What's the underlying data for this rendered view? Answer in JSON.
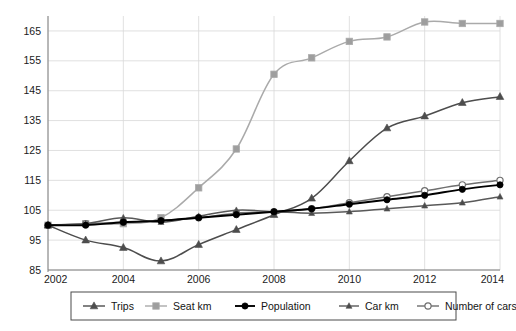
{
  "chart_data": {
    "type": "line",
    "title": "",
    "subtitle": "",
    "xlabel": "",
    "ylabel": "",
    "x": [
      2002,
      2003,
      2004,
      2005,
      2006,
      2007,
      2008,
      2009,
      2010,
      2011,
      2012,
      2013,
      2014
    ],
    "xlim": [
      2002,
      2014
    ],
    "ylim": [
      85,
      170
    ],
    "x_tick_labels": [
      "2002",
      "2004",
      "2006",
      "2008",
      "2010",
      "2012",
      "2014"
    ],
    "x_ticks": [
      2002,
      2004,
      2006,
      2008,
      2010,
      2012,
      2014
    ],
    "y_tick_labels": [
      "85",
      "95",
      "105",
      "115",
      "125",
      "135",
      "145",
      "155",
      "165"
    ],
    "y_ticks": [
      85,
      95,
      105,
      115,
      125,
      135,
      145,
      155,
      165
    ],
    "grid": true,
    "legend_position": "bottom",
    "series": [
      {
        "name": "Trips",
        "color": "#4d4d4d",
        "marker": "triangle",
        "marker_fill": "#4d4d4d",
        "values": [
          100,
          95,
          92.5,
          88,
          93.5,
          98.5,
          103.5,
          109,
          121.5,
          132.5,
          136.5,
          141,
          143
        ]
      },
      {
        "name": "Seat km",
        "color": "#aaaaaa",
        "marker": "square",
        "marker_fill": "#9e9e9e",
        "values": [
          100,
          100.5,
          100.5,
          102.5,
          112.5,
          125.5,
          150.5,
          156,
          161.5,
          163,
          168,
          167.5,
          167.5
        ]
      },
      {
        "name": "Population",
        "color": "#000000",
        "marker": "circle",
        "marker_fill": "#000000",
        "values": [
          100,
          100,
          101,
          101.5,
          102.5,
          103.5,
          104.5,
          105.5,
          107,
          108.5,
          110,
          112,
          113.5
        ]
      },
      {
        "name": "Car km",
        "color": "#595959",
        "marker": "triangle-small",
        "marker_fill": "#4a4a4a",
        "values": [
          100,
          100.5,
          102.5,
          101,
          103,
          105,
          104.5,
          104,
          104.5,
          105.5,
          106.5,
          107.5,
          109.5
        ]
      },
      {
        "name": "Number of cars",
        "color": "#6e6e6e",
        "marker": "circle-open",
        "marker_fill": "#ffffff",
        "values": [
          100,
          100.5,
          101,
          101.5,
          102.5,
          104,
          104.5,
          105.5,
          107.5,
          109.5,
          111.5,
          113.5,
          115
        ]
      }
    ]
  },
  "legend": {
    "items": [
      {
        "label": "Trips"
      },
      {
        "label": "Seat km"
      },
      {
        "label": "Population"
      },
      {
        "label": "Car km"
      },
      {
        "label": "Number of cars"
      }
    ]
  }
}
